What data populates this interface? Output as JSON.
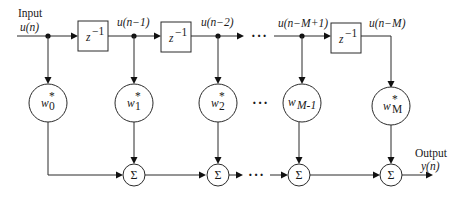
{
  "diagram": {
    "input": {
      "label": "Input",
      "signal": "u(n)"
    },
    "output": {
      "label": "Output",
      "signal": "y(n)"
    },
    "delays": [
      {
        "label": "z",
        "exponent": "−1"
      },
      {
        "label": "z",
        "exponent": "−1"
      },
      {
        "label": "z",
        "exponent": "−1"
      }
    ],
    "taps": [
      {
        "signal": "u(n−1)"
      },
      {
        "signal": "u(n−2)"
      },
      {
        "signal": "u(n−M+1)"
      },
      {
        "signal": "u(n−M)"
      }
    ],
    "weights": [
      {
        "base": "w",
        "sub": "0",
        "sup": "*"
      },
      {
        "base": "w",
        "sub": "1",
        "sup": "*"
      },
      {
        "base": "w",
        "sub": "2",
        "sup": "*"
      },
      {
        "base": "w",
        "sub": "M-1",
        "sup": ""
      },
      {
        "base": "w",
        "sub": "M",
        "sup": "*"
      }
    ],
    "summer_symbol": "Σ",
    "ellipsis": "···"
  }
}
